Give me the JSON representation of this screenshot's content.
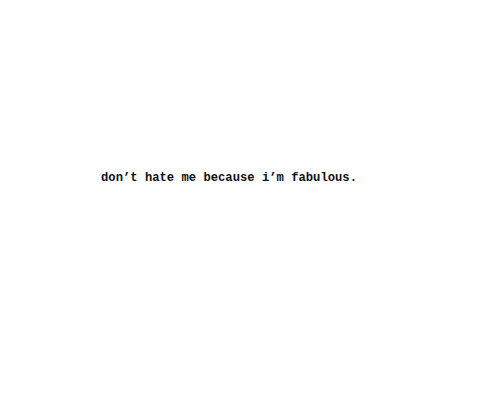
{
  "quote": {
    "text": "don’t hate me because i’m fabulous."
  }
}
